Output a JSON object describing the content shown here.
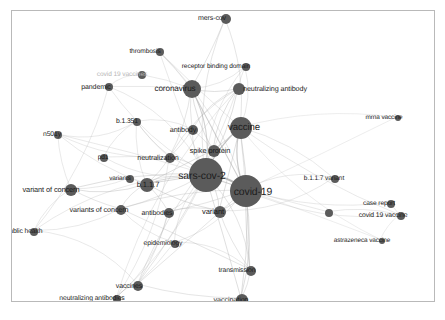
{
  "figure": {
    "kind": "keyword-co-occurrence-network",
    "width": 445,
    "height": 320,
    "background_color": "#ffffff",
    "frame_border_color": "#b9b9b9",
    "node_color": "#5b5b5b",
    "edge_color": "#b0b0b0",
    "label_color": "#1c1c1c",
    "faded_label_color": "#b7b7b7"
  },
  "chart_data": {
    "type": "scatter",
    "title": "",
    "xlabel": "",
    "ylabel": "",
    "grid": false,
    "legend": "none",
    "nodes": [
      {
        "label": "mers-cov",
        "x": 225,
        "y": 18,
        "size": 5,
        "font": 7.0,
        "label_dx": -14,
        "label_dy": -1,
        "faded": false
      },
      {
        "label": "thrombosis",
        "x": 159,
        "y": 51,
        "size": 4,
        "font": 6.6,
        "label_dx": -15,
        "label_dy": 0,
        "faded": false
      },
      {
        "label": "receptor binding domain",
        "x": 245,
        "y": 66,
        "size": 4,
        "font": 6.6,
        "label_dx": -30,
        "label_dy": 0,
        "faded": false
      },
      {
        "label": "covid 19 vaccines",
        "x": 141,
        "y": 74,
        "size": 4,
        "font": 6.6,
        "label_dx": -20,
        "label_dy": 0,
        "faded": true
      },
      {
        "label": "pandemic",
        "x": 108,
        "y": 86,
        "size": 4,
        "font": 7.0,
        "label_dx": -13,
        "label_dy": 0,
        "faded": false
      },
      {
        "label": "coronavirus",
        "x": 191,
        "y": 88,
        "size": 9,
        "font": 8.2,
        "label_dx": -17,
        "label_dy": 0,
        "faded": false
      },
      {
        "label": "neutralizing antibody",
        "x": 238,
        "y": 88,
        "size": 6,
        "font": 7.2,
        "label_dx": 36,
        "label_dy": 0,
        "faded": false
      },
      {
        "label": "mrna vaccine",
        "x": 397,
        "y": 117,
        "size": 3,
        "font": 6.4,
        "label_dx": -14,
        "label_dy": 0,
        "faded": false
      },
      {
        "label": "b.1.351",
        "x": 136,
        "y": 121,
        "size": 4,
        "font": 6.8,
        "label_dx": -10,
        "label_dy": 0,
        "faded": false
      },
      {
        "label": "antibody",
        "x": 192,
        "y": 129,
        "size": 5,
        "font": 7.2,
        "label_dx": -10,
        "label_dy": 0,
        "faded": false
      },
      {
        "label": "vaccine",
        "x": 240,
        "y": 127,
        "size": 11,
        "font": 9.6,
        "label_dx": 3,
        "label_dy": 0,
        "faded": false
      },
      {
        "label": "n501y",
        "x": 57,
        "y": 134,
        "size": 4,
        "font": 6.8,
        "label_dx": -6,
        "label_dy": 0,
        "faded": false
      },
      {
        "label": "spike protein",
        "x": 213,
        "y": 150,
        "size": 6,
        "font": 7.4,
        "label_dx": -4,
        "label_dy": 0,
        "faded": false
      },
      {
        "label": "neutralization",
        "x": 169,
        "y": 157,
        "size": 5,
        "font": 7.2,
        "label_dx": -12,
        "label_dy": 0,
        "faded": false
      },
      {
        "label": "pd1",
        "x": 103,
        "y": 157,
        "size": 4,
        "font": 6.6,
        "label_dx": -1,
        "label_dy": 0,
        "faded": false
      },
      {
        "label": "sars-cov-2",
        "x": 205,
        "y": 174,
        "size": 17,
        "font": 10.4,
        "label_dx": -4,
        "label_dy": 2,
        "faded": false
      },
      {
        "label": "b.1.1.7",
        "x": 146,
        "y": 184,
        "size": 7,
        "font": 7.6,
        "label_dx": 1,
        "label_dy": 0,
        "faded": false
      },
      {
        "label": "variants",
        "x": 129,
        "y": 178,
        "size": 4,
        "font": 6.4,
        "label_dx": -10,
        "label_dy": 0,
        "faded": false
      },
      {
        "label": "variant of concern",
        "x": 70,
        "y": 189,
        "size": 6,
        "font": 7.4,
        "label_dx": -20,
        "label_dy": 0,
        "faded": false
      },
      {
        "label": "b.1.1.7 variant",
        "x": 334,
        "y": 178,
        "size": 4,
        "font": 6.6,
        "label_dx": -11,
        "label_dy": 0,
        "faded": false
      },
      {
        "label": "covid-19",
        "x": 245,
        "y": 190,
        "size": 16,
        "font": 10.4,
        "label_dx": 7,
        "label_dy": 2,
        "faded": false
      },
      {
        "label": "case report",
        "x": 390,
        "y": 203,
        "size": 4,
        "font": 6.6,
        "label_dx": -12,
        "label_dy": 0,
        "faded": false
      },
      {
        "label": "variants of concern",
        "x": 120,
        "y": 209,
        "size": 5,
        "font": 7.2,
        "label_dx": -22,
        "label_dy": 0,
        "faded": false
      },
      {
        "label": "antibodies",
        "x": 168,
        "y": 212,
        "size": 5,
        "font": 7.0,
        "label_dx": -12,
        "label_dy": 0,
        "faded": false
      },
      {
        "label": "variant",
        "x": 219,
        "y": 211,
        "size": 6,
        "font": 7.6,
        "label_dx": -7,
        "label_dy": 0,
        "faded": false
      },
      {
        "label": "covid 19 vaccine",
        "x": 400,
        "y": 215,
        "size": 4,
        "font": 6.8,
        "label_dx": -18,
        "label_dy": 0,
        "faded": false
      },
      {
        "label": "unlabeled-node-right",
        "x": 328,
        "y": 212,
        "size": 4,
        "font": 0,
        "label_dx": 0,
        "label_dy": 0,
        "faded": false,
        "hide_label": true
      },
      {
        "label": "public health",
        "x": 33,
        "y": 231,
        "size": 4,
        "font": 6.8,
        "label_dx": -10,
        "label_dy": 0,
        "faded": false
      },
      {
        "label": "epidemiology",
        "x": 174,
        "y": 243,
        "size": 4,
        "font": 6.8,
        "label_dx": -12,
        "label_dy": 0,
        "faded": false
      },
      {
        "label": "astrazeneca vaccine",
        "x": 381,
        "y": 240,
        "size": 3,
        "font": 6.4,
        "label_dx": -20,
        "label_dy": 0,
        "faded": false
      },
      {
        "label": "transmission",
        "x": 250,
        "y": 270,
        "size": 5,
        "font": 6.8,
        "label_dx": -14,
        "label_dy": 0,
        "faded": false
      },
      {
        "label": "vaccines",
        "x": 137,
        "y": 285,
        "size": 5,
        "font": 7.0,
        "label_dx": -9,
        "label_dy": 0,
        "faded": false
      },
      {
        "label": "neutralizing antibodies",
        "x": 116,
        "y": 298,
        "size": 4,
        "font": 6.8,
        "label_dx": -25,
        "label_dy": 0,
        "faded": false
      },
      {
        "label": "vaccination",
        "x": 241,
        "y": 299,
        "size": 6,
        "font": 7.2,
        "label_dx": -11,
        "label_dy": 0,
        "faded": false
      }
    ],
    "edges": [
      {
        "from": "sars-cov-2",
        "to": "covid-19"
      },
      {
        "from": "sars-cov-2",
        "to": "vaccine"
      },
      {
        "from": "sars-cov-2",
        "to": "coronavirus"
      },
      {
        "from": "sars-cov-2",
        "to": "spike protein"
      },
      {
        "from": "sars-cov-2",
        "to": "antibody"
      },
      {
        "from": "sars-cov-2",
        "to": "neutralization"
      },
      {
        "from": "sars-cov-2",
        "to": "neutralizing antibody"
      },
      {
        "from": "sars-cov-2",
        "to": "b.1.1.7"
      },
      {
        "from": "sars-cov-2",
        "to": "variant"
      },
      {
        "from": "sars-cov-2",
        "to": "antibodies"
      },
      {
        "from": "sars-cov-2",
        "to": "variants of concern"
      },
      {
        "from": "sars-cov-2",
        "to": "variant of concern"
      },
      {
        "from": "sars-cov-2",
        "to": "epidemiology"
      },
      {
        "from": "sars-cov-2",
        "to": "transmission"
      },
      {
        "from": "sars-cov-2",
        "to": "vaccination"
      },
      {
        "from": "sars-cov-2",
        "to": "vaccines"
      },
      {
        "from": "sars-cov-2",
        "to": "neutralizing antibodies"
      },
      {
        "from": "sars-cov-2",
        "to": "pandemic"
      },
      {
        "from": "sars-cov-2",
        "to": "thrombosis"
      },
      {
        "from": "sars-cov-2",
        "to": "mers-cov"
      },
      {
        "from": "sars-cov-2",
        "to": "receptor binding domain"
      },
      {
        "from": "sars-cov-2",
        "to": "b.1.351"
      },
      {
        "from": "sars-cov-2",
        "to": "n501y"
      },
      {
        "from": "sars-cov-2",
        "to": "pd1"
      },
      {
        "from": "sars-cov-2",
        "to": "public health"
      },
      {
        "from": "covid-19",
        "to": "vaccine"
      },
      {
        "from": "covid-19",
        "to": "vaccination"
      },
      {
        "from": "covid-19",
        "to": "transmission"
      },
      {
        "from": "covid-19",
        "to": "variant"
      },
      {
        "from": "covid-19",
        "to": "epidemiology"
      },
      {
        "from": "covid-19",
        "to": "antibodies"
      },
      {
        "from": "covid-19",
        "to": "b.1.1.7 variant"
      },
      {
        "from": "covid-19",
        "to": "case report"
      },
      {
        "from": "covid-19",
        "to": "covid 19 vaccine"
      },
      {
        "from": "covid-19",
        "to": "astrazeneca vaccine"
      },
      {
        "from": "covid-19",
        "to": "mrna vaccine"
      },
      {
        "from": "covid-19",
        "to": "unlabeled-node-right"
      },
      {
        "from": "covid-19",
        "to": "coronavirus"
      },
      {
        "from": "covid-19",
        "to": "thrombosis"
      },
      {
        "from": "covid-19",
        "to": "pandemic"
      },
      {
        "from": "covid-19",
        "to": "variants of concern"
      },
      {
        "from": "covid-19",
        "to": "vaccines"
      },
      {
        "from": "covid-19",
        "to": "b.1.1.7"
      },
      {
        "from": "coronavirus",
        "to": "mers-cov"
      },
      {
        "from": "coronavirus",
        "to": "receptor binding domain"
      },
      {
        "from": "coronavirus",
        "to": "neutralizing antibody"
      },
      {
        "from": "coronavirus",
        "to": "antibody"
      },
      {
        "from": "coronavirus",
        "to": "spike protein"
      },
      {
        "from": "coronavirus",
        "to": "pandemic"
      },
      {
        "from": "coronavirus",
        "to": "thrombosis"
      },
      {
        "from": "coronavirus",
        "to": "covid 19 vaccines"
      },
      {
        "from": "coronavirus",
        "to": "neutralization"
      },
      {
        "from": "vaccine",
        "to": "vaccination"
      },
      {
        "from": "vaccine",
        "to": "vaccines"
      },
      {
        "from": "vaccine",
        "to": "mrna vaccine"
      },
      {
        "from": "vaccine",
        "to": "covid 19 vaccine"
      },
      {
        "from": "vaccine",
        "to": "astrazeneca vaccine"
      },
      {
        "from": "vaccine",
        "to": "thrombosis"
      },
      {
        "from": "vaccine",
        "to": "mers-cov"
      },
      {
        "from": "vaccine",
        "to": "receptor binding domain"
      },
      {
        "from": "vaccine",
        "to": "spike protein"
      },
      {
        "from": "vaccine",
        "to": "variant"
      },
      {
        "from": "vaccine",
        "to": "b.1.1.7 variant"
      },
      {
        "from": "vaccine",
        "to": "transmission"
      },
      {
        "from": "neutralizing antibody",
        "to": "neutralization"
      },
      {
        "from": "neutralizing antibody",
        "to": "antibody"
      },
      {
        "from": "neutralizing antibody",
        "to": "spike protein"
      },
      {
        "from": "neutralizing antibody",
        "to": "neutralizing antibodies"
      },
      {
        "from": "neutralization",
        "to": "b.1.351"
      },
      {
        "from": "neutralization",
        "to": "n501y"
      },
      {
        "from": "neutralization",
        "to": "b.1.1.7"
      },
      {
        "from": "neutralization",
        "to": "antibody"
      },
      {
        "from": "neutralization",
        "to": "pd1"
      },
      {
        "from": "neutralization",
        "to": "neutralizing antibodies"
      },
      {
        "from": "b.1.1.7",
        "to": "variant of concern"
      },
      {
        "from": "b.1.1.7",
        "to": "variants"
      },
      {
        "from": "b.1.1.7",
        "to": "variants of concern"
      },
      {
        "from": "b.1.1.7",
        "to": "b.1.351"
      },
      {
        "from": "b.1.1.7",
        "to": "n501y"
      },
      {
        "from": "b.1.1.7",
        "to": "antibodies"
      },
      {
        "from": "b.1.1.7",
        "to": "variant"
      },
      {
        "from": "b.1.1.7",
        "to": "spike protein"
      },
      {
        "from": "variant of concern",
        "to": "variants of concern"
      },
      {
        "from": "variant of concern",
        "to": "public health"
      },
      {
        "from": "variant of concern",
        "to": "variants"
      },
      {
        "from": "variant of concern",
        "to": "n501y"
      },
      {
        "from": "variants of concern",
        "to": "public health"
      },
      {
        "from": "variants of concern",
        "to": "epidemiology"
      },
      {
        "from": "variants of concern",
        "to": "transmission"
      },
      {
        "from": "antibodies",
        "to": "variant"
      },
      {
        "from": "antibodies",
        "to": "neutralizing antibodies"
      },
      {
        "from": "antibodies",
        "to": "vaccines"
      },
      {
        "from": "vaccines",
        "to": "vaccination"
      },
      {
        "from": "vaccines",
        "to": "neutralizing antibodies"
      },
      {
        "from": "vaccination",
        "to": "transmission"
      },
      {
        "from": "epidemiology",
        "to": "transmission"
      },
      {
        "from": "epidemiology",
        "to": "vaccines"
      },
      {
        "from": "pandemic",
        "to": "public health"
      },
      {
        "from": "pandemic",
        "to": "covid 19 vaccines"
      },
      {
        "from": "b.1.351",
        "to": "n501y"
      },
      {
        "from": "b.1.351",
        "to": "antibody"
      },
      {
        "from": "b.1.351",
        "to": "pd1"
      },
      {
        "from": "spike protein",
        "to": "antibody"
      },
      {
        "from": "spike protein",
        "to": "receptor binding domain"
      },
      {
        "from": "case report",
        "to": "covid 19 vaccine"
      },
      {
        "from": "covid 19 vaccine",
        "to": "astrazeneca vaccine"
      },
      {
        "from": "unlabeled-node-right",
        "to": "covid 19 vaccine"
      },
      {
        "from": "public health",
        "to": "vaccines"
      },
      {
        "from": "variant",
        "to": "transmission"
      },
      {
        "from": "variant",
        "to": "b.1.1.7 variant"
      }
    ]
  }
}
